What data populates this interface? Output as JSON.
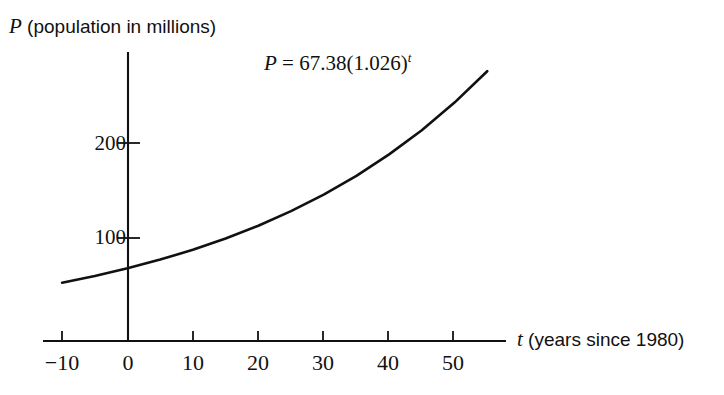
{
  "chart_data": {
    "type": "line",
    "title": "",
    "xlabel": "t (years since 1980)",
    "ylabel": "P (population in millions)",
    "annotation": "P = 67.38(1.026)",
    "annotation_exponent": "t",
    "equation": {
      "variable": "P",
      "equals": " = ",
      "coefficient": "67.38",
      "base_open": "(",
      "base": "1.026",
      "base_close": ")",
      "exponent": "t"
    },
    "axis_label_y_var": "P",
    "axis_label_y_text": " (population in millions)",
    "axis_label_x_var": "t",
    "axis_label_x_text": " (years since 1980)",
    "xlim": [
      -11,
      57
    ],
    "ylim": [
      0,
      290
    ],
    "xticks": [
      -10,
      0,
      10,
      20,
      30,
      40,
      50
    ],
    "xtick_labels": [
      "−10",
      "0",
      "10",
      "20",
      "30",
      "40",
      "50"
    ],
    "yticks": [
      100,
      200
    ],
    "ytick_labels": [
      "100",
      "200"
    ],
    "grid": false,
    "legend": "none",
    "curve_color": "#111111",
    "axis_color": "#111111",
    "background": "#ffffff",
    "x": [
      -10,
      -5,
      0,
      5,
      10,
      15,
      20,
      25,
      30,
      35,
      40,
      45,
      50,
      55
    ],
    "values": [
      52.1,
      59.3,
      67.38,
      76.6,
      87.0,
      98.9,
      112.5,
      127.9,
      145.4,
      165.2,
      187.9,
      213.5,
      242.8,
      276.0
    ]
  }
}
